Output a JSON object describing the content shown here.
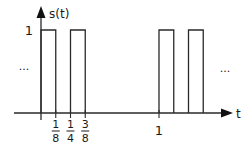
{
  "chart_data": {
    "type": "line",
    "title": "",
    "xlabel": "t",
    "ylabel": "s(t)",
    "xlim": [
      -0.1,
      1.5
    ],
    "ylim": [
      0,
      1
    ],
    "y_ticks": [
      {
        "value": 1,
        "label": "1"
      }
    ],
    "x_ticks": [
      {
        "value": 0.125,
        "num": "1",
        "den": "8"
      },
      {
        "value": 0.25,
        "num": "1",
        "den": "4"
      },
      {
        "value": 0.375,
        "num": "3",
        "den": "8"
      },
      {
        "value": 1,
        "label": "1"
      }
    ],
    "pulses": [
      {
        "start": 0,
        "end": 0.125,
        "height": 1
      },
      {
        "start": 0.25,
        "end": 0.375,
        "height": 1
      },
      {
        "start": 1,
        "end": 1.125,
        "height": 1
      },
      {
        "start": 1.25,
        "end": 1.375,
        "height": 1
      }
    ],
    "ellipsis_left": "...",
    "ellipsis_right": "...",
    "grid": false,
    "legend": "none"
  }
}
